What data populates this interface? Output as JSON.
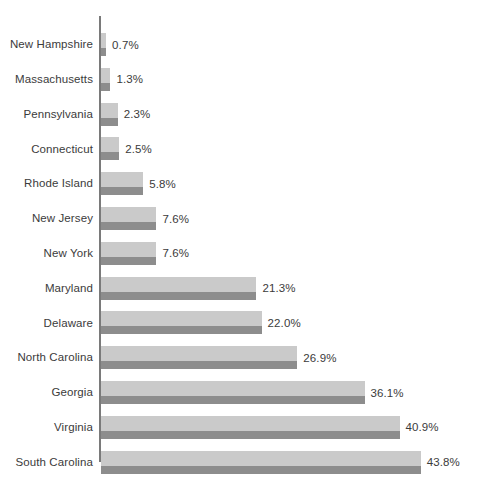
{
  "chart": {
    "background_color": "#ffffff",
    "axis_color": "#7a7a7a",
    "bar_light_color": "#cacaca",
    "bar_dark_color": "#8d8d8d",
    "label_color": "#3b3b3b"
  },
  "chart_data": {
    "type": "bar",
    "orientation": "horizontal",
    "title": "",
    "subtitle": "",
    "xlabel": "",
    "ylabel": "",
    "grid": false,
    "legend": false,
    "xlim": [
      0,
      43.8
    ],
    "value_suffix": "%",
    "categories": [
      "New Hampshire",
      "Massachusetts",
      "Pennsylvania",
      "Connecticut",
      "Rhode Island",
      "New Jersey",
      "New York",
      "Maryland",
      "Delaware",
      "North Carolina",
      "Georgia",
      "Virginia",
      "South Carolina"
    ],
    "values": [
      0.7,
      1.3,
      2.3,
      2.5,
      5.8,
      7.6,
      7.6,
      21.3,
      22.0,
      26.9,
      36.1,
      40.9,
      43.8
    ],
    "data_labels": [
      "0.7%",
      "1.3%",
      "2.3%",
      "2.5%",
      "5.8%",
      "7.6%",
      "7.6%",
      "21.3%",
      "22.0%",
      "26.9%",
      "36.1%",
      "40.9%",
      "43.8%"
    ]
  }
}
